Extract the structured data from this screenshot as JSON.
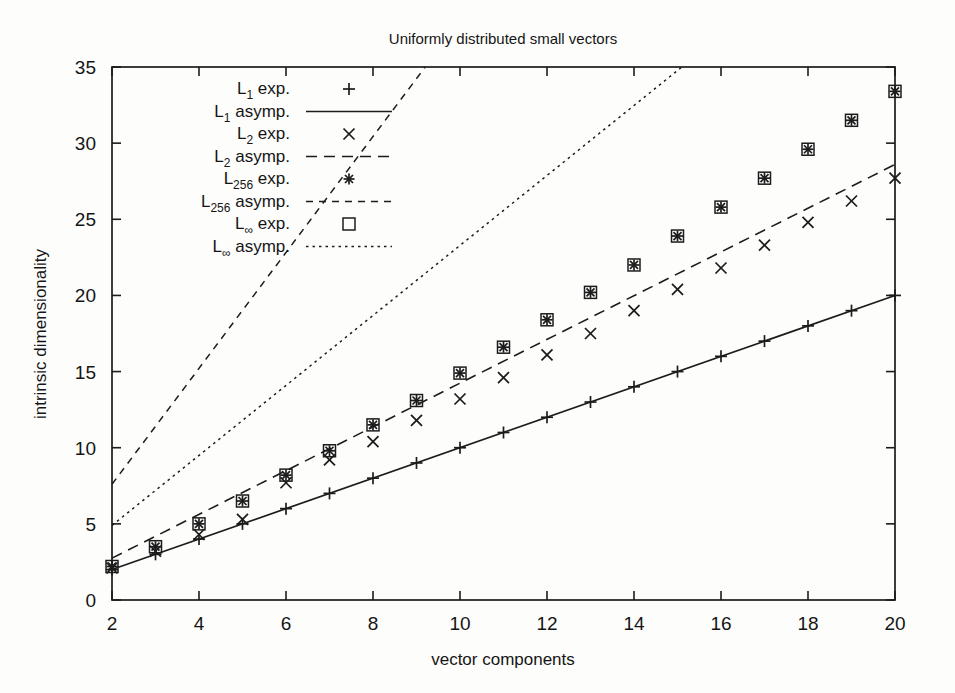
{
  "chart_data": {
    "type": "scatter",
    "title": "Uniformly distributed small vectors",
    "xlabel": "vector components",
    "ylabel": "intrinsic dimensionality",
    "xlim": [
      2,
      20
    ],
    "ylim": [
      0,
      35
    ],
    "xticks": [
      2,
      4,
      6,
      8,
      10,
      12,
      14,
      16,
      18,
      20
    ],
    "yticks": [
      0,
      5,
      10,
      15,
      20,
      25,
      30,
      35
    ],
    "xtick_labels": [
      "2",
      "4",
      "6",
      "8",
      "10",
      "12",
      "14",
      "16",
      "18",
      "20"
    ],
    "ytick_labels": [
      "0",
      "5",
      "10",
      "15",
      "20",
      "25",
      "30",
      "35"
    ],
    "grid": false,
    "legend_position": "top-left-inside",
    "x": [
      2,
      3,
      4,
      5,
      6,
      7,
      8,
      9,
      10,
      11,
      12,
      13,
      14,
      15,
      16,
      17,
      18,
      19,
      20
    ],
    "series": [
      {
        "name": "L_1 exp.",
        "legend_label": "L",
        "legend_sub": "1",
        "legend_suffix": " exp.",
        "kind": "points",
        "marker": "plus",
        "values": [
          2.0,
          3.0,
          4.0,
          5.0,
          6.0,
          7.0,
          8.0,
          9.0,
          10.0,
          11.0,
          12.0,
          13.0,
          14.0,
          15.0,
          16.0,
          17.0,
          18.0,
          19.0,
          20.0
        ]
      },
      {
        "name": "L_1 asymp.",
        "legend_label": "L",
        "legend_sub": "1",
        "legend_suffix": " asymp.",
        "kind": "line",
        "dash": "solid",
        "endpoints": [
          [
            2,
            2.0
          ],
          [
            20,
            20.0
          ]
        ]
      },
      {
        "name": "L_2 exp.",
        "legend_label": "L",
        "legend_sub": "2",
        "legend_suffix": " exp.",
        "kind": "points",
        "marker": "cross",
        "values": [
          2.1,
          3.2,
          4.3,
          5.3,
          7.7,
          9.2,
          10.4,
          11.8,
          13.2,
          14.6,
          16.1,
          17.5,
          19.0,
          20.4,
          21.8,
          23.3,
          24.8,
          26.2,
          27.7
        ]
      },
      {
        "name": "L_2 asymp.",
        "legend_label": "L",
        "legend_sub": "2",
        "legend_suffix": " asymp.",
        "kind": "line",
        "dash": "dashed",
        "endpoints": [
          [
            2,
            2.75
          ],
          [
            20,
            28.6
          ]
        ]
      },
      {
        "name": "L_256 exp.",
        "legend_label": "L",
        "legend_sub": "256",
        "legend_suffix": " exp.",
        "kind": "points",
        "marker": "star",
        "values": [
          2.2,
          3.5,
          5.0,
          6.5,
          8.2,
          9.8,
          11.5,
          13.1,
          14.9,
          16.6,
          18.4,
          20.2,
          22.0,
          23.9,
          25.8,
          27.7,
          29.6,
          31.5,
          33.4
        ]
      },
      {
        "name": "L_256 asymp.",
        "legend_label": "L",
        "legend_sub": "256",
        "legend_suffix": " asymp.",
        "kind": "line",
        "dash": "finedash",
        "endpoints": [
          [
            2,
            7.6
          ],
          [
            9.2,
            35
          ]
        ]
      },
      {
        "name": "L_inf exp.",
        "legend_label": "L",
        "legend_sub": "∞",
        "legend_suffix": " exp.",
        "kind": "points",
        "marker": "square",
        "values": [
          2.2,
          3.5,
          5.0,
          6.5,
          8.2,
          9.8,
          11.5,
          13.1,
          14.9,
          16.6,
          18.4,
          20.2,
          22.0,
          23.9,
          25.8,
          27.7,
          29.6,
          31.5,
          33.4
        ]
      },
      {
        "name": "L_inf asymp.",
        "legend_label": "L",
        "legend_sub": "∞",
        "legend_suffix": " asymp.",
        "kind": "line",
        "dash": "dotted",
        "endpoints": [
          [
            2,
            4.9
          ],
          [
            15.1,
            35
          ]
        ]
      }
    ]
  },
  "legend": {
    "entries": [
      {
        "base": "L",
        "sub": "1",
        "suffix": " exp.",
        "sample": "plus"
      },
      {
        "base": "L",
        "sub": "1",
        "suffix": " asymp.",
        "sample": "solid"
      },
      {
        "base": "L",
        "sub": "2",
        "suffix": " exp.",
        "sample": "cross"
      },
      {
        "base": "L",
        "sub": "2",
        "suffix": " asymp.",
        "sample": "dashed"
      },
      {
        "base": "L",
        "sub": "256",
        "suffix": " exp.",
        "sample": "star"
      },
      {
        "base": "L",
        "sub": "256",
        "suffix": " asymp.",
        "sample": "finedash"
      },
      {
        "base": "L",
        "sub": "∞",
        "suffix": " exp.",
        "sample": "square"
      },
      {
        "base": "L",
        "sub": "∞",
        "suffix": " asymp.",
        "sample": "dotted"
      }
    ]
  }
}
